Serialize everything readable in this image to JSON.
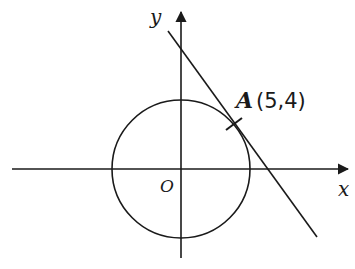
{
  "diagram": {
    "axes": {
      "x_label": "x",
      "y_label": "y",
      "origin_label": "O"
    },
    "circle": {
      "center": "O",
      "description": "circle centered at origin"
    },
    "point": {
      "name": "A",
      "coords": "(5,4)"
    },
    "tangent_line": {
      "description": "tangent line to circle at A"
    },
    "colors": {
      "stroke": "#1a1a1a",
      "background": "#ffffff"
    }
  }
}
